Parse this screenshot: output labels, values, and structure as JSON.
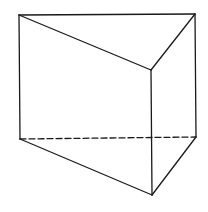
{
  "diagram": {
    "type": "triangular-prism",
    "background": "#ffffff",
    "stroke_color": "#1a1a1a",
    "stroke_width": 1.3,
    "dash_pattern": "6 3",
    "vertices": {
      "top_back_left": [
        19,
        15
      ],
      "top_back_right": [
        195,
        14
      ],
      "top_front": [
        151,
        70
      ],
      "bottom_back_left": [
        20,
        139
      ],
      "bottom_back_right": [
        196,
        137
      ],
      "bottom_front": [
        152,
        195
      ]
    },
    "edges": [
      {
        "name": "top-back-edge",
        "from": "top_back_left",
        "to": "top_back_right",
        "hidden": false
      },
      {
        "name": "top-left-edge",
        "from": "top_back_left",
        "to": "top_front",
        "hidden": false
      },
      {
        "name": "top-right-edge",
        "from": "top_back_right",
        "to": "top_front",
        "hidden": false
      },
      {
        "name": "left-vertical-edge",
        "from": "top_back_left",
        "to": "bottom_back_left",
        "hidden": false
      },
      {
        "name": "right-vertical-edge",
        "from": "top_back_right",
        "to": "bottom_back_right",
        "hidden": false
      },
      {
        "name": "front-vertical-edge",
        "from": "top_front",
        "to": "bottom_front",
        "hidden": false
      },
      {
        "name": "bottom-left-edge",
        "from": "bottom_back_left",
        "to": "bottom_front",
        "hidden": false
      },
      {
        "name": "bottom-right-edge",
        "from": "bottom_back_right",
        "to": "bottom_front",
        "hidden": false
      },
      {
        "name": "bottom-back-edge-hidden",
        "from": "bottom_back_left",
        "to": "bottom_back_right",
        "hidden": true
      }
    ]
  }
}
